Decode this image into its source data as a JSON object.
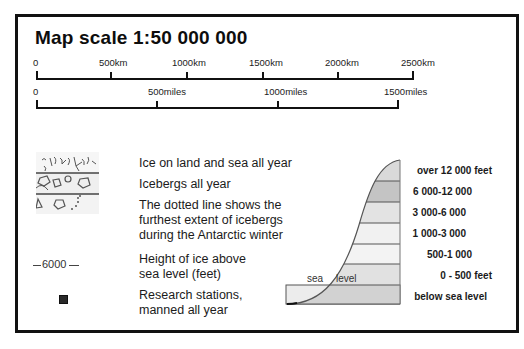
{
  "title": "Map scale  1:50 000 000",
  "scale_km": {
    "ticks": [
      "0",
      "500km",
      "1000km",
      "1500km",
      "2000km",
      "2500km"
    ]
  },
  "scale_miles": {
    "ticks": [
      "0",
      "500miles",
      "1000miles",
      "1500miles"
    ]
  },
  "legend": {
    "items": [
      {
        "icon": "ice-land-sea-pattern",
        "label": "Ice on land and sea all year"
      },
      {
        "icon": "icebergs-pattern",
        "label": "Icebergs all year"
      },
      {
        "icon": "dotted-line-pattern",
        "label_lines": [
          "The dotted line shows the",
          "furthest extent of icebergs",
          "during the Antarctic winter"
        ]
      },
      {
        "icon": "contour-line",
        "icon_text": "6000",
        "label_lines": [
          "Height of ice above",
          "sea level (feet)"
        ]
      },
      {
        "icon": "research-station-square",
        "label_lines": [
          "Research stations,",
          "manned all year"
        ]
      }
    ]
  },
  "cross_section": {
    "sea_label": "sea",
    "level_label": "level",
    "bands": [
      {
        "label": "over 12 000 feet",
        "color": "#d9d9d9"
      },
      {
        "label": "6 000-12 000",
        "color": "#c4c4c4"
      },
      {
        "label": "3 000-6 000",
        "color": "#e3e3e3"
      },
      {
        "label": "1 000-3 000",
        "color": "#f1f1f1"
      },
      {
        "label": "500-1 000",
        "color": "#f3f3f3"
      },
      {
        "label": "0 - 500 feet",
        "color": "#e1e1e1"
      },
      {
        "label": "below sea level",
        "color": "#d2d2d2"
      }
    ]
  },
  "colors": {
    "frame": "#111111",
    "sea": "#ececec"
  }
}
